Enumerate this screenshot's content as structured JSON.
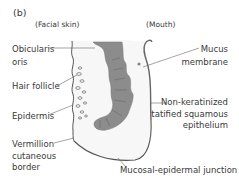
{
  "figure": {
    "panel_label": "(b)",
    "region_labels": {
      "left": "(Facial skin)",
      "right": "(Mouth)"
    },
    "labels": {
      "orbicularis_oris": [
        "Obicularis",
        "oris"
      ],
      "hair_follicle": "Hair follicle",
      "epidermis": "Epidermis",
      "vermillion_border": [
        "Vermillion",
        "cutaneous",
        "border"
      ],
      "mucus_membrane": [
        "Mucus",
        "membrane"
      ],
      "epithelium": [
        "Non-keratinized",
        "statified squamous",
        "epithelium"
      ],
      "junction": "Mucosal-epidermal junction"
    },
    "colors": {
      "muscle": "#8a8a8a",
      "muscle_dark": "#6e6e6e",
      "outline": "#555555",
      "leader": "#666666",
      "skin_fill": "#f2f2f2"
    }
  }
}
